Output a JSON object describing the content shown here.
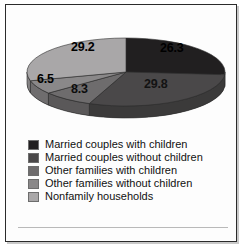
{
  "chart_data": {
    "type": "pie",
    "title": "",
    "subtitle": "",
    "xlabel": "",
    "ylabel": "",
    "grid": false,
    "legend_position": "bottom",
    "three_d": true,
    "start_angle_deg": 0,
    "direction": "clockwise",
    "value_unit": "percent",
    "total": 100.1,
    "categories": [
      "Married couples with children",
      "Married couples without children",
      "Other families with children",
      "Other families without children",
      "Nonfamily households"
    ],
    "values": [
      26.3,
      29.8,
      8.3,
      6.5,
      29.2
    ],
    "labels": [
      "26.3",
      "29.8",
      "8.3",
      "6.5",
      "29.2"
    ],
    "colors": [
      "#211f20",
      "#4a4849",
      "#6e6c6d",
      "#8a8889",
      "#a9a7a8"
    ],
    "side_colors": [
      "#1a1819",
      "#3b3a3a",
      "#5a5859",
      "#6f6d6e",
      "#868485"
    ],
    "slices": [
      {
        "label": "26.3",
        "value": 26.3,
        "category": "Married couples with children",
        "color": "#211f20"
      },
      {
        "label": "29.8",
        "value": 29.8,
        "category": "Married couples without children",
        "color": "#4a4849"
      },
      {
        "label": "8.3",
        "value": 8.3,
        "category": "Other families with children",
        "color": "#6e6c6d"
      },
      {
        "label": "6.5",
        "value": 6.5,
        "category": "Other families without children",
        "color": "#8a8889"
      },
      {
        "label": "29.2",
        "value": 29.2,
        "category": "Nonfamily households",
        "color": "#a9a7a8"
      }
    ]
  },
  "legend": {
    "items": [
      {
        "label": "Married couples with children",
        "color": "#211f20"
      },
      {
        "label": "Married couples without children",
        "color": "#4a4849"
      },
      {
        "label": "Other families with children",
        "color": "#6e6c6d"
      },
      {
        "label": "Other families without children",
        "color": "#8a8889"
      },
      {
        "label": "Nonfamily households",
        "color": "#a9a7a8"
      }
    ]
  }
}
